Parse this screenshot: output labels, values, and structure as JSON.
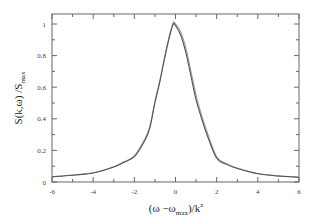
{
  "chart_data": {
    "type": "line",
    "title": "",
    "xlabel": "(ω −ω_max)/k^z",
    "ylabel": "S(k,ω) /S_max",
    "xlabel_parts": {
      "main": "(ω −ω",
      "sub": "max",
      "tail": ")/k",
      "sup": "z"
    },
    "ylabel_parts": {
      "main": "S(k,ω) /S",
      "sub": "max"
    },
    "xlim": [
      -6,
      6
    ],
    "ylim": [
      0,
      1.06
    ],
    "x_ticks": [
      -6,
      -4,
      -2,
      0,
      2,
      4,
      6
    ],
    "x_tick_labels": [
      "-6",
      "-4",
      "-2",
      "0",
      "2",
      "4",
      "6"
    ],
    "y_ticks": [
      0,
      0.2,
      0.4,
      0.6,
      0.8,
      1
    ],
    "y_tick_labels": [
      "0",
      "0.2",
      "0.4",
      "0.6",
      "0.8",
      "1"
    ],
    "grid": false,
    "legend": null,
    "series": [
      {
        "name": "curve 1",
        "color": "#555555",
        "x": [
          -6,
          -5,
          -4,
          -3,
          -2.5,
          -2,
          -1.5,
          -1.25,
          -1,
          -0.75,
          -0.5,
          -0.25,
          -0.1,
          0,
          0.25,
          0.5,
          0.75,
          1,
          1.25,
          1.5,
          2,
          2.5,
          3,
          4,
          5,
          6
        ],
        "y": [
          0.033,
          0.043,
          0.057,
          0.095,
          0.125,
          0.16,
          0.26,
          0.34,
          0.5,
          0.64,
          0.8,
          0.94,
          1.0,
          0.99,
          0.93,
          0.82,
          0.67,
          0.52,
          0.41,
          0.31,
          0.15,
          0.11,
          0.085,
          0.052,
          0.038,
          0.03
        ]
      },
      {
        "name": "curve 2",
        "color": "#999999",
        "x": [
          -6,
          -5,
          -4,
          -3,
          -2.5,
          -2,
          -1.5,
          -1.25,
          -1,
          -0.75,
          -0.5,
          -0.25,
          -0.1,
          0,
          0.25,
          0.5,
          0.75,
          1,
          1.25,
          1.5,
          2,
          2.5,
          3,
          4,
          5,
          6
        ],
        "y": [
          0.034,
          0.044,
          0.058,
          0.097,
          0.128,
          0.165,
          0.27,
          0.35,
          0.51,
          0.65,
          0.81,
          0.95,
          1.01,
          1.0,
          0.95,
          0.85,
          0.7,
          0.55,
          0.43,
          0.33,
          0.16,
          0.115,
          0.088,
          0.054,
          0.039,
          0.031
        ]
      }
    ]
  }
}
